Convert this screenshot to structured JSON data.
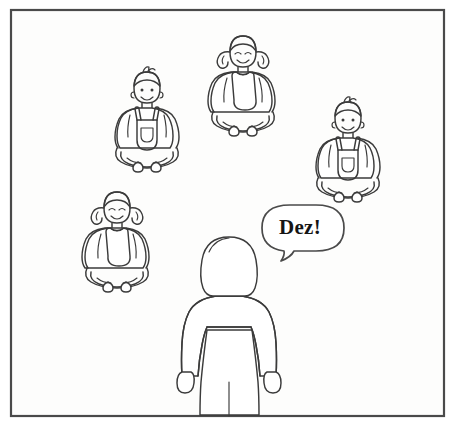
{
  "panel": {
    "border_color": "#4a4a4a",
    "background_color": "#fdfdfc",
    "ink_color": "#3b3b3b",
    "width": 455,
    "height": 426
  },
  "speech_bubble": {
    "text": "Dez!",
    "shape": "rounded-oval",
    "tail_direction": "left-down",
    "text_color": "#151515",
    "fill_color": "#ffffff"
  },
  "standing_figure": {
    "name": "girl-standing-back-view",
    "description": "girl seen from behind with bob haircut, sweater, skirt and legs",
    "hair_style": "bob",
    "clothing": "sweater and skirt",
    "view": "back"
  },
  "seated_children": [
    {
      "id": "child-1",
      "name": "boy-sitting-upper-left",
      "gender": "boy",
      "hair": "short-with-cowlick",
      "clothing": "overalls-with-front-pocket",
      "pose": "cross-legged",
      "x": 147,
      "y": 118
    },
    {
      "id": "child-2",
      "name": "girl-sitting-top-center",
      "gender": "girl",
      "hair": "pigtails",
      "clothing": "pinafore-over-tshirt",
      "pose": "cross-legged",
      "x": 243,
      "y": 82
    },
    {
      "id": "child-3",
      "name": "boy-sitting-right",
      "gender": "boy",
      "hair": "short-with-cowlick",
      "clothing": "overalls-with-front-pocket",
      "pose": "cross-legged",
      "x": 348,
      "y": 148
    },
    {
      "id": "child-4",
      "name": "girl-sitting-lower-left",
      "gender": "girl",
      "hair": "pigtails",
      "clothing": "pinafore-over-tshirt",
      "pose": "cross-legged",
      "x": 117,
      "y": 238
    }
  ],
  "ground": {
    "name": "ground-line",
    "description": "bottom panel border doubles as the floor line"
  }
}
